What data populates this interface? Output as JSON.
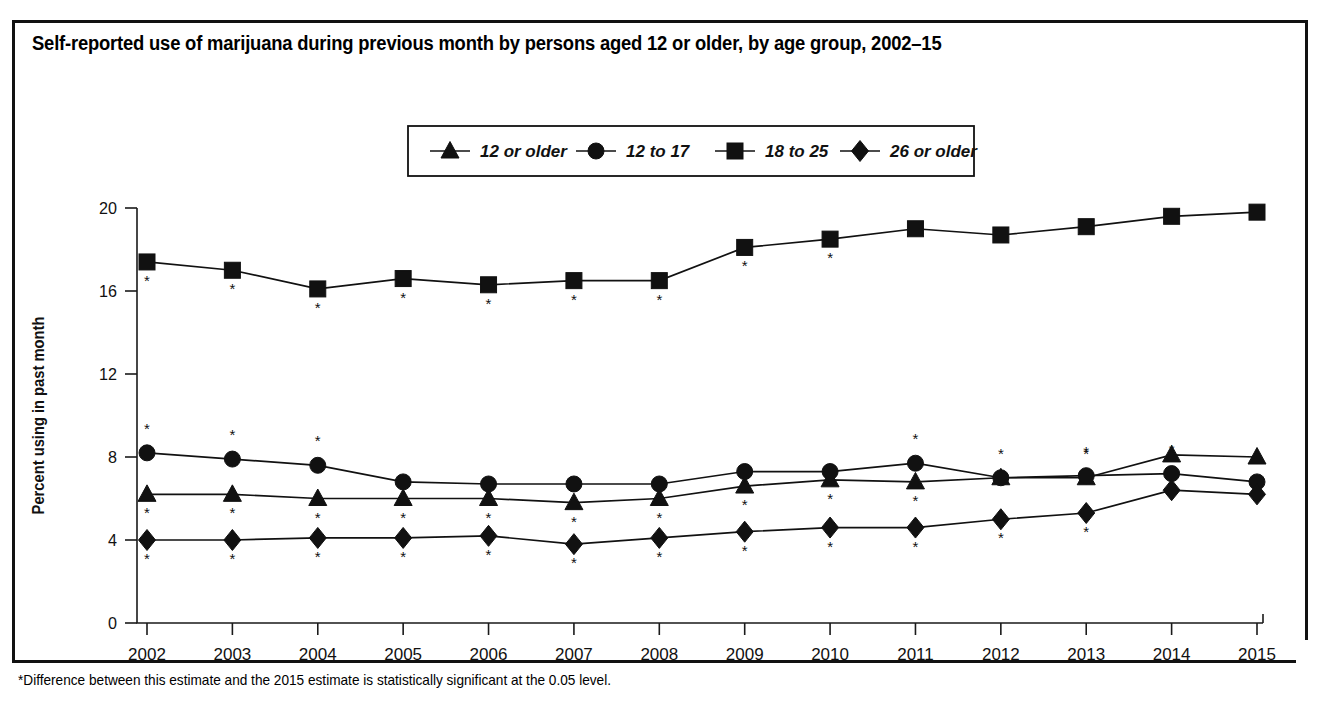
{
  "figure": {
    "title": "Self-reported use of marijuana during previous month by persons aged 12 or older, by age group, 2002–15",
    "footnote": "*Difference between this estimate and the 2015 estimate is statistically significant at the 0.05 level."
  },
  "chart_data": {
    "type": "line",
    "title": "Self-reported use of marijuana during previous month by persons aged 12 or older, by age group, 2002–15",
    "xlabel": "",
    "ylabel": "Percent using in past month",
    "x": [
      2002,
      2003,
      2004,
      2005,
      2006,
      2007,
      2008,
      2009,
      2010,
      2011,
      2012,
      2013,
      2014,
      2015
    ],
    "xtick_labels": [
      "2002",
      "2003",
      "2004",
      "2005",
      "2006",
      "2007",
      "2008",
      "2009",
      "2010",
      "2011",
      "2012",
      "2013",
      "2014",
      "2015"
    ],
    "ylim": [
      0,
      20
    ],
    "yticks": [
      0,
      4,
      8,
      12,
      16,
      20
    ],
    "ytick_labels": [
      "0",
      "4",
      "8",
      "12",
      "16",
      "20"
    ],
    "grid": false,
    "legend_position": "top-center",
    "significance_marker": "*",
    "series": [
      {
        "name": "12 or older",
        "marker": "triangle",
        "values": [
          6.2,
          6.2,
          6.0,
          6.0,
          6.0,
          5.8,
          6.0,
          6.6,
          6.9,
          6.8,
          7.0,
          7.0,
          8.1,
          8.0
        ],
        "significant": [
          true,
          true,
          true,
          true,
          true,
          true,
          true,
          true,
          true,
          true,
          true,
          true,
          false,
          false
        ],
        "star_side": [
          "below",
          "below",
          "below",
          "below",
          "below",
          "below",
          "below",
          "below",
          "below",
          "below",
          "above",
          "above",
          "",
          ""
        ]
      },
      {
        "name": "12 to 17",
        "marker": "circle",
        "values": [
          8.2,
          7.9,
          7.6,
          6.8,
          6.7,
          6.7,
          6.7,
          7.3,
          7.3,
          7.7,
          7.0,
          7.1,
          7.2,
          6.8
        ],
        "significant": [
          true,
          true,
          true,
          false,
          false,
          false,
          false,
          false,
          false,
          true,
          false,
          true,
          true,
          false
        ],
        "star_side": [
          "above",
          "above",
          "above",
          "",
          "",
          "",
          "",
          "",
          "",
          "above",
          "",
          "above",
          "above",
          ""
        ]
      },
      {
        "name": "18 to 25",
        "marker": "square",
        "values": [
          17.4,
          17.0,
          16.1,
          16.6,
          16.3,
          16.5,
          16.5,
          18.1,
          18.5,
          19.0,
          18.7,
          19.1,
          19.6,
          19.8
        ],
        "significant": [
          true,
          true,
          true,
          true,
          true,
          true,
          true,
          true,
          true,
          false,
          false,
          false,
          false,
          false
        ],
        "star_side": [
          "below",
          "below",
          "below",
          "below",
          "below",
          "below",
          "below",
          "below",
          "below",
          "",
          "",
          "",
          "",
          ""
        ]
      },
      {
        "name": "26 or older",
        "marker": "diamond",
        "values": [
          4.0,
          4.0,
          4.1,
          4.1,
          4.2,
          3.8,
          4.1,
          4.4,
          4.6,
          4.6,
          5.0,
          5.3,
          6.4,
          6.2
        ],
        "significant": [
          true,
          true,
          true,
          true,
          true,
          true,
          true,
          true,
          true,
          true,
          true,
          true,
          false,
          false
        ],
        "star_side": [
          "below",
          "below",
          "below",
          "below",
          "below",
          "below",
          "below",
          "below",
          "below",
          "below",
          "below",
          "below",
          "",
          ""
        ]
      }
    ]
  },
  "legend": {
    "items": [
      {
        "label": "12 or older",
        "marker": "triangle"
      },
      {
        "label": "12 to 17",
        "marker": "circle"
      },
      {
        "label": "18 to 25",
        "marker": "square"
      },
      {
        "label": "26 or older",
        "marker": "diamond"
      }
    ]
  },
  "colors": {
    "ink": "#111111",
    "paper": "#ffffff"
  }
}
